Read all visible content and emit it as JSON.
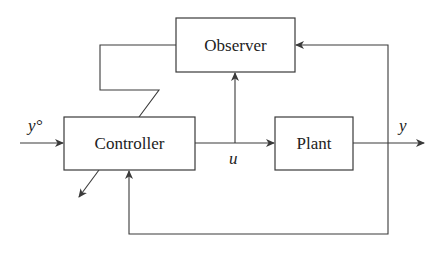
{
  "diagram": {
    "title": "",
    "blocks": {
      "observer": {
        "label": "Observer"
      },
      "controller": {
        "label": "Controller"
      },
      "plant": {
        "label": "Plant"
      }
    },
    "signals": {
      "reference": {
        "label": "y°"
      },
      "control": {
        "label": "u"
      },
      "output": {
        "label": "y"
      }
    },
    "colors": {
      "line": "#3a3a3a",
      "text": "#222222",
      "background": "#ffffff"
    }
  }
}
